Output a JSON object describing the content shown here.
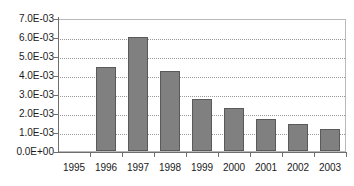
{
  "chart_data": {
    "type": "bar",
    "title": "",
    "subtitle": "",
    "xlabel": "",
    "ylabel": "",
    "categories": [
      "1995",
      "1996",
      "1997",
      "1998",
      "1999",
      "2000",
      "2001",
      "2002",
      "2003"
    ],
    "values": [
      0,
      0.0044,
      0.006,
      0.0042,
      0.00275,
      0.00225,
      0.0017,
      0.0014,
      0.00115
    ],
    "ylim": [
      0,
      0.007
    ],
    "ytick_values": [
      0,
      0.001,
      0.002,
      0.003,
      0.004,
      0.005,
      0.006,
      0.007
    ],
    "ytick_labels": [
      "0.0E+00",
      "1.0E-03",
      "2.0E-03",
      "3.0E-03",
      "4.0E-03",
      "5.0E-03",
      "6.0E-03",
      "7.0E-03"
    ],
    "grid": true,
    "legend": false,
    "legend_position": "none",
    "series": [
      {
        "name": "",
        "values": [
          0,
          0.0044,
          0.006,
          0.0042,
          0.00275,
          0.00225,
          0.0017,
          0.0014,
          0.00115
        ]
      }
    ],
    "colors": {
      "bar_fill": "#808080",
      "bar_border": "#5a5a5a",
      "gridline": "#9a9a9a",
      "axis": "#6e6e6e",
      "plot_border": "#b9b9b9",
      "text": "#1a1a1a",
      "background": "#ffffff"
    }
  }
}
